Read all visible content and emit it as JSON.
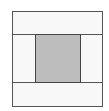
{
  "diagram": {
    "colors": {
      "border": "#555555",
      "cell_fill": "#f8f8f8",
      "center_fill": "#bdbdbd"
    },
    "regions": [
      {
        "id": "top-strip",
        "shaded": false
      },
      {
        "id": "left-cell",
        "shaded": false
      },
      {
        "id": "center-square",
        "shaded": true
      },
      {
        "id": "right-cell",
        "shaded": false
      },
      {
        "id": "bottom-strip",
        "shaded": false
      }
    ]
  }
}
